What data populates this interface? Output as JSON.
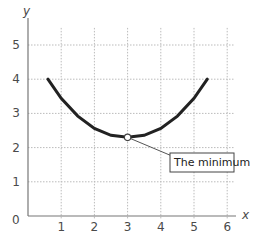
{
  "chart_data": {
    "type": "line",
    "title": "",
    "xlabel": "x",
    "ylabel": "y",
    "xlim": [
      0,
      6
    ],
    "ylim": [
      0,
      5.5
    ],
    "x_ticks": [
      "1",
      "2",
      "3",
      "4",
      "5",
      "6"
    ],
    "y_ticks": [
      "1",
      "2",
      "3",
      "4",
      "5"
    ],
    "origin_label": "0",
    "grid": true,
    "series": [
      {
        "name": "curve",
        "color": "#222222",
        "x": [
          0.6,
          1.0,
          1.5,
          2.0,
          2.5,
          3.0,
          3.5,
          4.0,
          4.5,
          5.0,
          5.4
        ],
        "values": [
          4.0,
          3.44,
          2.92,
          2.56,
          2.36,
          2.3,
          2.36,
          2.56,
          2.92,
          3.44,
          4.0
        ]
      }
    ],
    "annotations": [
      {
        "text": "The minimum",
        "point": {
          "x": 3,
          "y": 2.3
        }
      }
    ]
  }
}
